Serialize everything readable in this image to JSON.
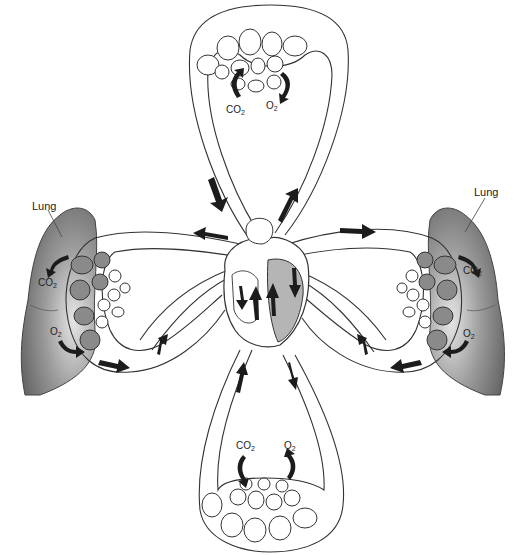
{
  "diagram": {
    "type": "circulatory-gas-exchange-schematic",
    "labels": {
      "lung_left": "Lung",
      "lung_right": "Lung",
      "top_co2": "CO",
      "top_co2_sub": "2",
      "top_o2": "O",
      "top_o2_sub": "2",
      "left_co2": "CO",
      "left_co2_sub": "2",
      "left_o2": "O",
      "left_o2_sub": "2",
      "right_co2": "CO",
      "right_co2_sub": "2",
      "right_o2": "O",
      "right_o2_sub": "2",
      "bottom_co2": "CO",
      "bottom_co2_sub": "2",
      "bottom_o2": "O",
      "bottom_o2_sub": "2"
    },
    "colors": {
      "line": "#333333",
      "arrow": "#1c1c1c",
      "lung_fill_dark": "#6e6e6e",
      "lung_fill_light": "#d8d8d8",
      "alveolus_dark": "#8a8a8a"
    }
  }
}
